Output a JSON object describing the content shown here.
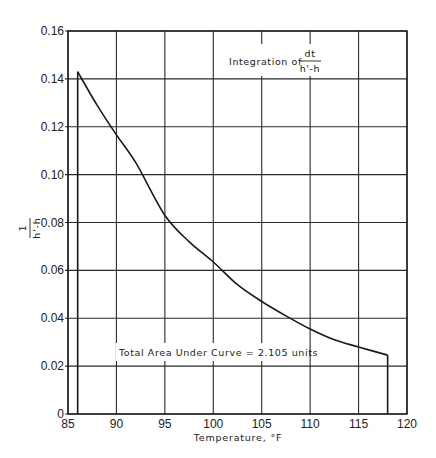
{
  "chart_data": {
    "type": "line",
    "title": "",
    "xlabel": "Temperature, °F",
    "ylabel": "1 / (h' - h)",
    "ylabel_numerator": "1",
    "ylabel_denominator": "h'-h",
    "xlim": [
      85,
      120
    ],
    "ylim": [
      0,
      0.16
    ],
    "grid": true,
    "x_ticks": [
      85,
      90,
      95,
      100,
      105,
      110,
      115,
      120
    ],
    "x_tick_labels": [
      "85",
      "90",
      "95",
      "100",
      "105",
      "110",
      "115",
      "120"
    ],
    "y_ticks": [
      0,
      0.02,
      0.04,
      0.06,
      0.08,
      0.1,
      0.12,
      0.14,
      0.16
    ],
    "y_tick_labels": [
      "0",
      "0.02",
      "0.04",
      "0.06",
      "0.08",
      "0.10",
      "0.12",
      "0.14",
      "0.16"
    ],
    "series": [
      {
        "name": "1/(h'-h)",
        "x": [
          86,
          88,
          90,
          92,
          95,
          97.5,
          100,
          102.5,
          105,
          107.5,
          110,
          112.5,
          115,
          118
        ],
        "y": [
          0.143,
          0.129,
          0.1166,
          0.105,
          0.083,
          0.072,
          0.0635,
          0.054,
          0.047,
          0.041,
          0.0355,
          0.031,
          0.028,
          0.0246
        ]
      }
    ],
    "area_bounds": {
      "x_start": 86,
      "x_end": 118
    },
    "annotations": [
      {
        "text": "Integration of",
        "fraction_numerator": "dt",
        "fraction_denominator": "h'-h",
        "x": 103,
        "y": 0.15
      },
      {
        "text": "Total Area Under Curve = 2.105 units",
        "x": 102,
        "y": 0.026
      }
    ]
  },
  "labels": {
    "integration_prefix": "Integration of",
    "integration_num": "dt",
    "integration_den": "h'-h",
    "total_area": "Total Area Under Curve = 2.105 units",
    "xlabel": "Temperature, °F",
    "ylabel_num": "1",
    "ylabel_den": "h'-h"
  },
  "colors": {
    "line": "#1a1a1a",
    "grid": "#2a2a2a",
    "background": "#ffffff"
  }
}
